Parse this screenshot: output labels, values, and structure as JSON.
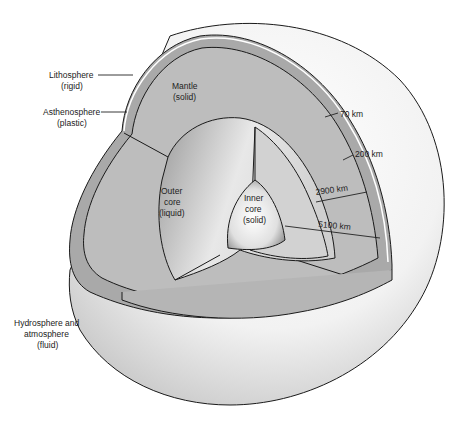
{
  "diagram": {
    "layers": [
      {
        "id": "lithosphere",
        "name": "Lithosphere",
        "state": "(rigid)"
      },
      {
        "id": "asthenosphere",
        "name": "Asthenosphere",
        "state": "(plastic)"
      },
      {
        "id": "mantle",
        "name": "Mantle",
        "state": "(solid)"
      },
      {
        "id": "outer-core",
        "name_lines": [
          "Outer",
          "core"
        ],
        "state": "(liquid)"
      },
      {
        "id": "inner-core",
        "name_lines": [
          "Inner",
          "core"
        ],
        "state": "(solid)"
      },
      {
        "id": "hydrosphere",
        "name_lines": [
          "Hydrosphere and",
          "atmosphere"
        ],
        "state": "(fluid)"
      }
    ],
    "depths": [
      {
        "id": "d70",
        "label": "70 km"
      },
      {
        "id": "d200",
        "label": "200 km"
      },
      {
        "id": "d2900",
        "label": "2900 km"
      },
      {
        "id": "d5100",
        "label": "5100 km"
      }
    ],
    "colors": {
      "background": "#ffffff",
      "sphere_light": "#f4f4f4",
      "sphere_shade": "#c9c9c9",
      "crust_band": "#a9a9a9",
      "mantle": "#bdbdbd",
      "outer_core": "#d6d6d6",
      "inner_core": "#ededed",
      "line": "#1a1a1a"
    }
  }
}
